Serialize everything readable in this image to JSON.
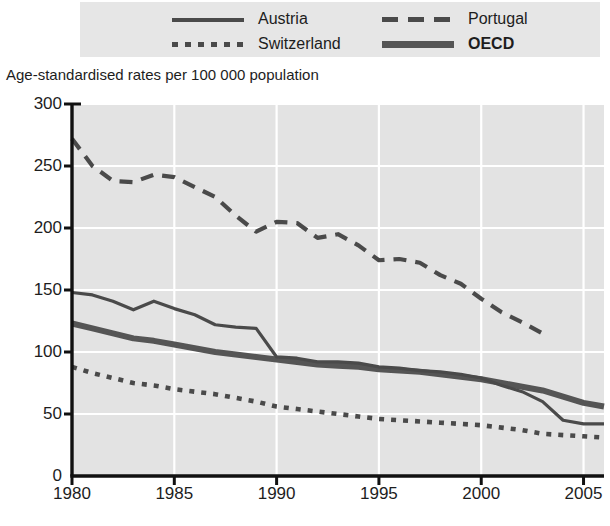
{
  "legend": {
    "items": [
      {
        "label": "Austria",
        "style": "solid-thin",
        "bold": false
      },
      {
        "label": "Portugal",
        "style": "dashed",
        "bold": false
      },
      {
        "label": "Switzerland",
        "style": "dotted",
        "bold": false
      },
      {
        "label": "OECD",
        "style": "solid-thick",
        "bold": true
      }
    ]
  },
  "axis_caption": "Age-standardised rates per 100 000 population",
  "colors": {
    "plot_background": "#e3e3e3",
    "legend_background": "#e6e6e6",
    "gridline": "#ffffff",
    "axis": "#111111",
    "series_austria": "#4a4a4a",
    "series_portugal": "#4a4a4a",
    "series_switzerland": "#4a4a4a",
    "series_oecd": "#555555"
  },
  "chart_data": {
    "type": "line",
    "title": "",
    "subtitle": "",
    "xlabel": "",
    "ylabel": "Age-standardised rates per 100 000 population",
    "xlim": [
      1980,
      2006
    ],
    "ylim": [
      0,
      300
    ],
    "yticks": [
      0,
      50,
      100,
      150,
      200,
      250,
      300
    ],
    "xticks": [
      1980,
      1985,
      1990,
      1995,
      2000,
      2005
    ],
    "ytick_labels": [
      "0",
      "50",
      "100",
      "150",
      "200",
      "250",
      "300"
    ],
    "xtick_labels": [
      "1980",
      "1985",
      "1990",
      "1995",
      "2000",
      "2005"
    ],
    "grid": true,
    "legend_position": "top",
    "series": [
      {
        "name": "Austria",
        "style": "solid-thin",
        "x": [
          1980,
          1981,
          1982,
          1983,
          1984,
          1985,
          1986,
          1987,
          1988,
          1989,
          1990,
          1991,
          1992,
          1993,
          1994,
          1995,
          1996,
          1997,
          1998,
          1999,
          2000,
          2001,
          2002,
          2003,
          2004,
          2005,
          2006
        ],
        "values": [
          148,
          146,
          141,
          134,
          141,
          135,
          130,
          122,
          120,
          119,
          96,
          95,
          92,
          92,
          91,
          88,
          87,
          85,
          84,
          82,
          79,
          73,
          68,
          60,
          45,
          42,
          42
        ]
      },
      {
        "name": "Portugal",
        "style": "dashed",
        "x": [
          1980,
          1981,
          1982,
          1983,
          1984,
          1985,
          1986,
          1987,
          1988,
          1989,
          1990,
          1991,
          1992,
          1993,
          1994,
          1995,
          1996,
          1997,
          1998,
          1999,
          2000,
          2001,
          2002,
          2003
        ],
        "values": [
          272,
          250,
          238,
          237,
          243,
          241,
          233,
          225,
          210,
          197,
          205,
          204,
          192,
          195,
          186,
          174,
          175,
          172,
          162,
          155,
          143,
          132,
          124,
          115
        ]
      },
      {
        "name": "Switzerland",
        "style": "dotted",
        "x": [
          1980,
          1981,
          1982,
          1983,
          1984,
          1985,
          1986,
          1987,
          1988,
          1989,
          1990,
          1991,
          1992,
          1993,
          1994,
          1995,
          1996,
          1997,
          1998,
          1999,
          2000,
          2001,
          2002,
          2003,
          2004,
          2005,
          2006
        ],
        "values": [
          88,
          83,
          79,
          75,
          73,
          70,
          68,
          66,
          63,
          60,
          56,
          54,
          52,
          50,
          48,
          46,
          45,
          44,
          43,
          42,
          41,
          39,
          37,
          34,
          33,
          32,
          31
        ]
      },
      {
        "name": "OECD",
        "style": "solid-thick",
        "x": [
          1980,
          1981,
          1982,
          1983,
          1984,
          1985,
          1986,
          1987,
          1988,
          1989,
          1990,
          1991,
          1992,
          1993,
          1994,
          1995,
          1996,
          1997,
          1998,
          1999,
          2000,
          2001,
          2002,
          2003,
          2004,
          2005,
          2006
        ],
        "values": [
          123,
          119,
          115,
          111,
          109,
          106,
          103,
          100,
          98,
          96,
          94,
          92,
          90,
          89,
          88,
          86,
          85,
          84,
          82,
          80,
          78,
          75,
          72,
          69,
          64,
          59,
          56
        ]
      }
    ]
  }
}
